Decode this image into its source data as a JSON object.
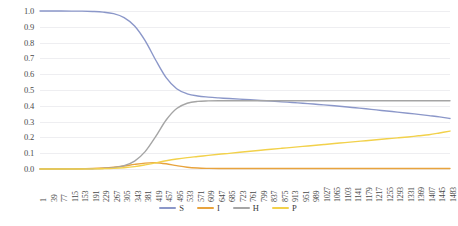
{
  "chart_data": {
    "type": "line",
    "title": "",
    "subtitle": "",
    "xlabel": "",
    "ylabel": "",
    "grid": true,
    "legend_position": "bottom",
    "xlim": [
      1,
      1483
    ],
    "ylim": [
      0.0,
      1.0
    ],
    "y_ticks": [
      "1.0",
      "0.9",
      "0.8",
      "0.7",
      "0.6",
      "0.5",
      "0.4",
      "0.3",
      "0.2",
      "0.1",
      "0.0"
    ],
    "x_tick_step": 38,
    "categories": [
      "1",
      "39",
      "77",
      "115",
      "153",
      "191",
      "229",
      "267",
      "305",
      "343",
      "381",
      "419",
      "457",
      "495",
      "533",
      "571",
      "609",
      "647",
      "685",
      "723",
      "761",
      "799",
      "837",
      "875",
      "913",
      "951",
      "989",
      "1027",
      "1065",
      "1103",
      "1141",
      "1179",
      "1217",
      "1255",
      "1293",
      "1331",
      "1369",
      "1407",
      "1445",
      "1483"
    ],
    "series": [
      {
        "name": "S",
        "color": "#8b97c9",
        "values": [
          1.0,
          1.0,
          1.0,
          0.999,
          0.999,
          0.997,
          0.993,
          0.983,
          0.958,
          0.905,
          0.812,
          0.69,
          0.578,
          0.508,
          0.476,
          0.462,
          0.455,
          0.45,
          0.446,
          0.442,
          0.438,
          0.434,
          0.43,
          0.425,
          0.421,
          0.416,
          0.411,
          0.406,
          0.4,
          0.394,
          0.388,
          0.381,
          0.374,
          0.367,
          0.36,
          0.353,
          0.346,
          0.338,
          0.33,
          0.32
        ]
      },
      {
        "name": "I",
        "color": "#e8a33d",
        "values": [
          0.0,
          0.0,
          0.0,
          0.001,
          0.002,
          0.003,
          0.006,
          0.011,
          0.019,
          0.029,
          0.037,
          0.04,
          0.033,
          0.021,
          0.011,
          0.006,
          0.004,
          0.003,
          0.003,
          0.003,
          0.003,
          0.003,
          0.003,
          0.003,
          0.003,
          0.003,
          0.003,
          0.003,
          0.003,
          0.003,
          0.003,
          0.003,
          0.003,
          0.003,
          0.003,
          0.003,
          0.003,
          0.003,
          0.003,
          0.003
        ]
      },
      {
        "name": "H",
        "color": "#a5a5a5",
        "values": [
          0.0,
          0.0,
          0.0,
          0.0,
          0.001,
          0.002,
          0.004,
          0.009,
          0.021,
          0.05,
          0.11,
          0.205,
          0.31,
          0.383,
          0.416,
          0.428,
          0.431,
          0.432,
          0.432,
          0.432,
          0.432,
          0.432,
          0.432,
          0.432,
          0.432,
          0.432,
          0.432,
          0.432,
          0.432,
          0.432,
          0.432,
          0.432,
          0.432,
          0.432,
          0.432,
          0.432,
          0.432,
          0.432,
          0.432,
          0.432
        ]
      },
      {
        "name": "P",
        "color": "#f2d14b",
        "values": [
          0.0,
          0.0,
          0.0,
          0.0,
          0.0,
          0.001,
          0.002,
          0.004,
          0.008,
          0.015,
          0.026,
          0.039,
          0.052,
          0.063,
          0.072,
          0.079,
          0.086,
          0.093,
          0.099,
          0.106,
          0.112,
          0.119,
          0.125,
          0.131,
          0.137,
          0.143,
          0.149,
          0.155,
          0.161,
          0.167,
          0.173,
          0.179,
          0.185,
          0.191,
          0.197,
          0.203,
          0.21,
          0.217,
          0.228,
          0.24
        ]
      }
    ]
  },
  "legend": {
    "items": [
      {
        "label": "S",
        "color": "#8b97c9"
      },
      {
        "label": "I",
        "color": "#e8a33d"
      },
      {
        "label": "H",
        "color": "#a5a5a5"
      },
      {
        "label": "P",
        "color": "#f2d14b"
      }
    ]
  }
}
